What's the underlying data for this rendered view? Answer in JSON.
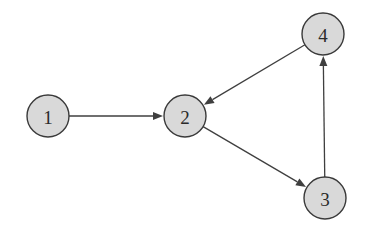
{
  "diagram": {
    "type": "directed-graph",
    "width": 370,
    "height": 236,
    "colors": {
      "node_fill": "#d9d9d9",
      "node_stroke": "#3a3a3a",
      "edge": "#3f3f3f",
      "label": "#2a2a2a",
      "background": "#ffffff"
    },
    "node_radius": 21,
    "nodes": [
      {
        "id": "1",
        "label": "1",
        "x": 48,
        "y": 116
      },
      {
        "id": "2",
        "label": "2",
        "x": 185,
        "y": 116
      },
      {
        "id": "3",
        "label": "3",
        "x": 325,
        "y": 198
      },
      {
        "id": "4",
        "label": "4",
        "x": 323,
        "y": 34
      }
    ],
    "edges": [
      {
        "from": "1",
        "to": "2"
      },
      {
        "from": "4",
        "to": "2"
      },
      {
        "from": "2",
        "to": "3"
      },
      {
        "from": "3",
        "to": "4"
      }
    ]
  }
}
